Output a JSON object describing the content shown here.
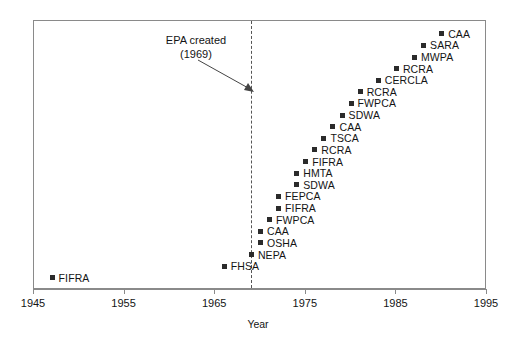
{
  "chart_data": {
    "type": "scatter",
    "title": "",
    "xlabel": "Year",
    "ylabel": "",
    "xlim": [
      1945,
      1995
    ],
    "xticks": [
      1945,
      1955,
      1965,
      1975,
      1985,
      1995
    ],
    "xtick_labels": [
      "1945",
      "1955",
      "1965",
      "1975",
      "1985",
      "1995"
    ],
    "grid": false,
    "legend": null,
    "marker_color": "#2b2b2b",
    "frame_color": "#8a8a8a",
    "annotations": [
      {
        "name": "epa-created",
        "line1": "EPA created",
        "line2": "(1969)",
        "x": 1969,
        "type": "vertical-dashed-line-with-arrow"
      }
    ],
    "points": [
      {
        "label": "FIFRA",
        "x": 1947,
        "rank": 1
      },
      {
        "label": "FHSA",
        "x": 1966,
        "rank": 2
      },
      {
        "label": "NEPA",
        "x": 1969,
        "rank": 3
      },
      {
        "label": "OSHA",
        "x": 1970,
        "rank": 4
      },
      {
        "label": "CAA",
        "x": 1970,
        "rank": 5
      },
      {
        "label": "FWPCA",
        "x": 1971,
        "rank": 6
      },
      {
        "label": "FIFRA",
        "x": 1972,
        "rank": 7
      },
      {
        "label": "FEPCA",
        "x": 1972,
        "rank": 8
      },
      {
        "label": "SDWA",
        "x": 1974,
        "rank": 9
      },
      {
        "label": "HMTA",
        "x": 1974,
        "rank": 10
      },
      {
        "label": "FIFRA",
        "x": 1975,
        "rank": 11
      },
      {
        "label": "RCRA",
        "x": 1976,
        "rank": 12
      },
      {
        "label": "TSCA",
        "x": 1977,
        "rank": 13
      },
      {
        "label": "CAA",
        "x": 1978,
        "rank": 14
      },
      {
        "label": "SDWA",
        "x": 1979,
        "rank": 15
      },
      {
        "label": "FWPCA",
        "x": 1980,
        "rank": 16
      },
      {
        "label": "RCRA",
        "x": 1981,
        "rank": 17
      },
      {
        "label": "CERCLA",
        "x": 1983,
        "rank": 18
      },
      {
        "label": "RCRA",
        "x": 1985,
        "rank": 19
      },
      {
        "label": "MWPA",
        "x": 1987,
        "rank": 20
      },
      {
        "label": "SARA",
        "x": 1988,
        "rank": 21
      },
      {
        "label": "CAA",
        "x": 1990,
        "rank": 22
      }
    ]
  }
}
